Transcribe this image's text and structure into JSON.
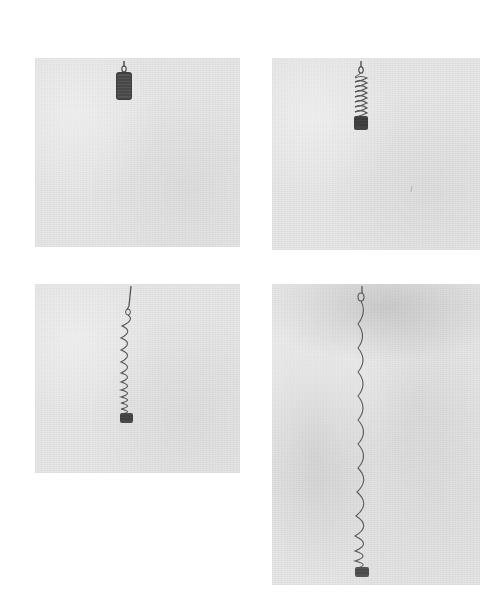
{
  "figure": {
    "background_color": "#ffffff",
    "panel_color": "#e6e6e6",
    "spring_color": "#555555",
    "panels": [
      {
        "id": "panel-1",
        "position": "top-left",
        "state": "compressed",
        "x": 35,
        "y": 58,
        "w": 205,
        "h": 189
      },
      {
        "id": "panel-2",
        "position": "top-right",
        "state": "slightly-extended",
        "x": 272,
        "y": 58,
        "w": 208,
        "h": 192
      },
      {
        "id": "panel-3",
        "position": "bottom-left",
        "state": "extended",
        "x": 35,
        "y": 284,
        "w": 205,
        "h": 189
      },
      {
        "id": "panel-4",
        "position": "bottom-right",
        "state": "fully-extended",
        "x": 272,
        "y": 284,
        "w": 208,
        "h": 301
      }
    ]
  }
}
